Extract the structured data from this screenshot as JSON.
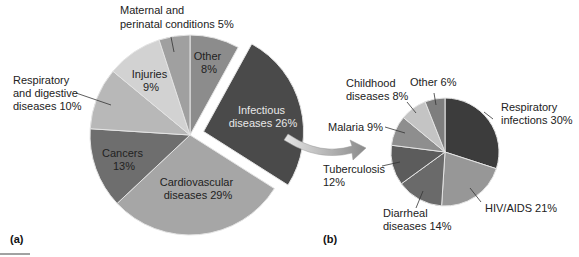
{
  "chart_data": [
    {
      "id": "a",
      "type": "pie",
      "panel_label": "(a)",
      "title": "",
      "start_angle_deg": 0,
      "direction": "clockwise",
      "slices": [
        {
          "label": "Other",
          "value": 8,
          "display": "Other\n8%",
          "color": "#8c8c8c"
        },
        {
          "label": "Infectious diseases",
          "value": 26,
          "display": "Infectious\ndiseases 26%",
          "color": "#4a4a4a",
          "exploded": true
        },
        {
          "label": "Cardiovascular diseases",
          "value": 29,
          "display": "Cardiovascular\ndiseases 29%",
          "color": "#a6a6a6"
        },
        {
          "label": "Cancers",
          "value": 13,
          "display": "Cancers\n13%",
          "color": "#6e6e6e"
        },
        {
          "label": "Respiratory and digestive diseases",
          "value": 10,
          "display": "Respiratory\nand digestive\ndiseases 10%",
          "color": "#b8b8b8"
        },
        {
          "label": "Injuries",
          "value": 9,
          "display": "Injuries\n9%",
          "color": "#d2d2d2"
        },
        {
          "label": "Maternal and perinatal conditions",
          "value": 5,
          "display": "Maternal and\nperinatal conditions 5%",
          "color": "#a0a0a0"
        }
      ]
    },
    {
      "id": "b",
      "type": "pie",
      "panel_label": "(b)",
      "title": "Breakdown of infectious diseases",
      "start_angle_deg": 0,
      "direction": "clockwise",
      "slices": [
        {
          "label": "Respiratory infections",
          "value": 30,
          "display": "Respiratory\ninfections 30%",
          "color": "#3c3c3c"
        },
        {
          "label": "HIV/AIDS",
          "value": 21,
          "display": "HIV/AIDS 21%",
          "color": "#979797"
        },
        {
          "label": "Diarrheal diseases",
          "value": 14,
          "display": "Diarrheal\ndiseases 14%",
          "color": "#6a6a6a"
        },
        {
          "label": "Tuberculosis",
          "value": 12,
          "display": "Tuberculosis\n12%",
          "color": "#5c5c5c"
        },
        {
          "label": "Malaria",
          "value": 9,
          "display": "Malaria 9%",
          "color": "#8e8e8e"
        },
        {
          "label": "Childhood diseases",
          "value": 8,
          "display": "Childhood\ndiseases 8%",
          "color": "#c4c4c4"
        },
        {
          "label": "Other",
          "value": 6,
          "display": "Other 6%",
          "color": "#7e7e7e"
        }
      ]
    }
  ],
  "labels": {
    "a": {
      "maternal": [
        "Maternal and",
        "perinatal conditions 5%"
      ],
      "other": [
        "Other",
        "8%"
      ],
      "injuries": [
        "Injuries",
        "9%"
      ],
      "resp_dig": [
        "Respiratory",
        "and digestive",
        "diseases 10%"
      ],
      "infectious": [
        "Infectious",
        "diseases 26%"
      ],
      "cancers": [
        "Cancers",
        "13%"
      ],
      "cardio": [
        "Cardiovascular",
        "diseases 29%"
      ],
      "panel": "(a)"
    },
    "b": {
      "childhood": [
        "Childhood",
        "diseases 8%"
      ],
      "other": "Other 6%",
      "respiratory": [
        "Respiratory",
        "infections 30%"
      ],
      "malaria": "Malaria 9%",
      "tb": [
        "Tuberculosis",
        "12%"
      ],
      "hiv": "HIV/AIDS 21%",
      "diarrheal": [
        "Diarrheal",
        "diseases 14%"
      ],
      "panel": "(b)"
    }
  }
}
